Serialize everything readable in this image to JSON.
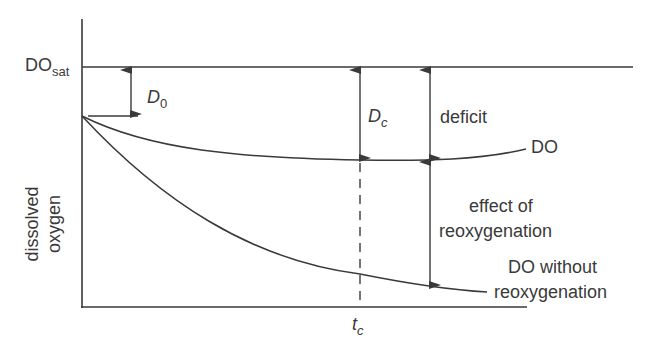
{
  "diagram": {
    "type": "oxygen-sag-curve",
    "y_axis_label_line1": "dissolved",
    "y_axis_label_line2": "oxygen",
    "do_sat": {
      "main": "DO",
      "sub": "sat"
    },
    "d0": {
      "main": "D",
      "sub": "0"
    },
    "dc": {
      "main": "D",
      "sub": "c"
    },
    "tc": {
      "main": "t",
      "sub": "c"
    },
    "deficit_label": "deficit",
    "do_label": "DO",
    "effect_label_line1": "effect of",
    "effect_label_line2": "reoxygenation",
    "without_label_line1": "DO without",
    "without_label_line2": "reoxygenation",
    "line_color": "#3a3a3a"
  }
}
